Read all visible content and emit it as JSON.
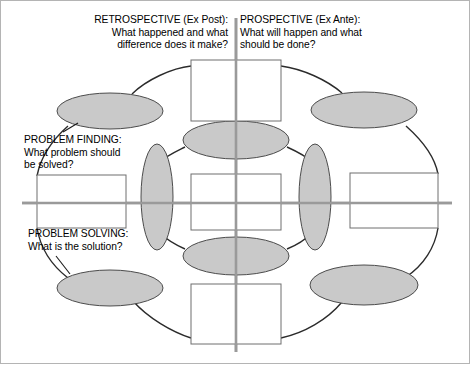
{
  "diagram": {
    "colors": {
      "node_fill": "#c9c9c9",
      "node_stroke": "#4c4c4c",
      "box_fill": "#ffffff",
      "box_stroke": "#6e6e6e",
      "ring_stroke": "#2b2b2b",
      "axis_stroke": "#9a9a9a",
      "page_border": "#b4b4b4",
      "text": "#000000"
    },
    "captions": {
      "retrospective": "RETROSPECTIVE (Ex Post):\nWhat happened and what\ndifference does it make?",
      "prospective": "PROSPECTIVE (Ex Ante):\nWhat will happen and what\nshould be done?",
      "problem_finding": "PROBLEM FINDING:\nWhat problem should\nbe solved?",
      "problem_solving": "PROBLEM SOLVING:\nWhat is the solution?"
    },
    "axes": {
      "vertical": {
        "x": 236,
        "y1": 18,
        "y2": 352
      },
      "horizontal": {
        "y": 203,
        "x1": 22,
        "x2": 452
      }
    },
    "boxes": [
      {
        "name": "box-top",
        "x": 191,
        "y": 60,
        "w": 90,
        "h": 61
      },
      {
        "name": "box-left",
        "x": 37,
        "y": 175,
        "w": 89,
        "h": 53
      },
      {
        "name": "box-center",
        "x": 191,
        "y": 174,
        "w": 90,
        "h": 56
      },
      {
        "name": "box-right",
        "x": 350,
        "y": 173,
        "w": 88,
        "h": 55
      },
      {
        "name": "box-bottom",
        "x": 191,
        "y": 284,
        "w": 90,
        "h": 60
      }
    ],
    "nodes": [
      {
        "name": "node-top-left",
        "cx": 110,
        "cy": 111,
        "rx": 53,
        "ry": 18,
        "rot": 0
      },
      {
        "name": "node-top-right",
        "cx": 364,
        "cy": 110,
        "rx": 53,
        "ry": 18,
        "rot": 0
      },
      {
        "name": "node-upper-center",
        "cx": 236,
        "cy": 140,
        "rx": 53,
        "ry": 19,
        "rot": 0
      },
      {
        "name": "node-mid-left",
        "cx": 157,
        "cy": 197,
        "rx": 16,
        "ry": 53,
        "rot": 0
      },
      {
        "name": "node-mid-right",
        "cx": 315,
        "cy": 197,
        "rx": 16,
        "ry": 53,
        "rot": 0
      },
      {
        "name": "node-lower-center",
        "cx": 236,
        "cy": 256,
        "rx": 53,
        "ry": 19,
        "rot": 0
      },
      {
        "name": "node-bottom-left",
        "cx": 110,
        "cy": 288,
        "rx": 53,
        "ry": 18,
        "rot": 0
      },
      {
        "name": "node-bottom-right",
        "cx": 364,
        "cy": 285,
        "rx": 54,
        "ry": 20,
        "rot": 0
      }
    ]
  }
}
